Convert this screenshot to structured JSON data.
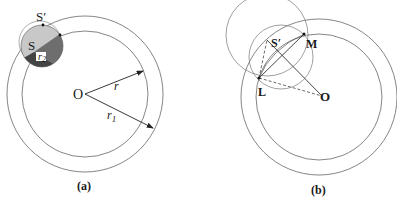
{
  "panel_a": {
    "caption": "(a)",
    "labels": {
      "S_prime": "S′",
      "S": "S",
      "r2": "r",
      "r2_sub": "2",
      "O": "O",
      "r": "r",
      "r1": "r",
      "r1_sub": "1"
    }
  },
  "panel_b": {
    "caption": "(b)",
    "labels": {
      "S_prime": "S′",
      "M": "M",
      "L": "L",
      "O": "O"
    }
  },
  "colors": {
    "stroke": "#555555",
    "light_gray": "#c8c8c8",
    "mid_gray": "#8a8a8a",
    "dark_gray": "#555555"
  }
}
